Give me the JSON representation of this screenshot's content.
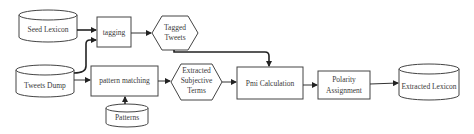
{
  "diagram": {
    "type": "flowchart",
    "nodes": {
      "seed_lexicon": {
        "label": "Seed Lexicon",
        "shape": "cylinder"
      },
      "tweets_dump": {
        "label": "Tweets Dump",
        "shape": "cylinder"
      },
      "patterns": {
        "label": "Patterns",
        "shape": "cylinder"
      },
      "tagging": {
        "label": "tagging",
        "shape": "rectangle"
      },
      "tagged_tweets": {
        "line1": "Tagged",
        "line2": "Tweets",
        "shape": "hexagon"
      },
      "pattern_matching": {
        "label": "pattern matching",
        "shape": "rectangle"
      },
      "extracted_subjective_terms": {
        "line1": "Extracted",
        "line2": "Subjective",
        "line3": "Terms",
        "shape": "hexagon"
      },
      "pmi_calculation": {
        "label": "Pmi Calculation",
        "shape": "rectangle"
      },
      "polarity_assignment": {
        "line1": "Polarity",
        "line2": "Assignment",
        "shape": "rectangle"
      },
      "extracted_lexicon": {
        "label": "Extracted Lexicon",
        "shape": "cylinder"
      }
    },
    "edges": [
      {
        "from": "Seed Lexicon",
        "to": "tagging"
      },
      {
        "from": "Tweets Dump",
        "to": "tagging"
      },
      {
        "from": "tagging",
        "to": "Tagged Tweets"
      },
      {
        "from": "Tweets Dump",
        "to": "pattern matching"
      },
      {
        "from": "Patterns",
        "to": "pattern matching"
      },
      {
        "from": "pattern matching",
        "to": "Extracted Subjective Terms"
      },
      {
        "from": "Tagged Tweets",
        "to": "Pmi Calculation"
      },
      {
        "from": "Extracted Subjective Terms",
        "to": "Pmi Calculation"
      },
      {
        "from": "Pmi Calculation",
        "to": "Polarity Assignment"
      },
      {
        "from": "Polarity Assignment",
        "to": "Extracted Lexicon"
      }
    ]
  }
}
